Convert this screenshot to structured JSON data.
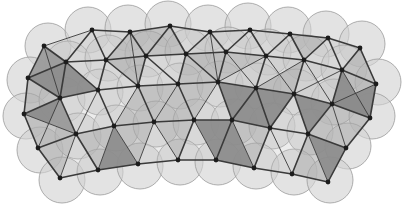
{
  "figure": {
    "type": "packing-triangulation-diagram",
    "title": "",
    "width": 404,
    "height": 222,
    "background_color": "#ffffff"
  },
  "style": {
    "disc_fill": "#d2d2d2",
    "disc_stroke": "#9a9a9a",
    "disc_opacity": 0.62,
    "disc_stroke_width": 0.8,
    "triangle_light_fill": "#c0c0c0",
    "triangle_dark_fill": "#8c8c8c",
    "triangle_mid_fill": "#a8a8a8",
    "edge_color": "#3a3a3a",
    "edge_width": 1.6,
    "edge_width_thin": 0.9,
    "node_color": "#1c1c1c",
    "node_radius": 2.4
  },
  "chart_data": {
    "type": "scatter",
    "title": "",
    "xlabel": "",
    "ylabel": "",
    "xlim": [
      0,
      404
    ],
    "ylim": [
      0,
      222
    ],
    "grid": false,
    "legend": null,
    "disc_radius": 23,
    "discs": [
      [
        48,
        46
      ],
      [
        88,
        30
      ],
      [
        128,
        28
      ],
      [
        168,
        24
      ],
      [
        208,
        28
      ],
      [
        248,
        26
      ],
      [
        288,
        30
      ],
      [
        326,
        34
      ],
      [
        362,
        44
      ],
      [
        30,
        80
      ],
      [
        68,
        64
      ],
      [
        108,
        58
      ],
      [
        148,
        54
      ],
      [
        188,
        52
      ],
      [
        228,
        50
      ],
      [
        268,
        52
      ],
      [
        306,
        58
      ],
      [
        344,
        68
      ],
      [
        378,
        82
      ],
      [
        26,
        116
      ],
      [
        62,
        100
      ],
      [
        100,
        92
      ],
      [
        140,
        88
      ],
      [
        180,
        86
      ],
      [
        220,
        84
      ],
      [
        258,
        86
      ],
      [
        296,
        92
      ],
      [
        334,
        102
      ],
      [
        372,
        116
      ],
      [
        40,
        150
      ],
      [
        78,
        136
      ],
      [
        116,
        128
      ],
      [
        156,
        124
      ],
      [
        196,
        122
      ],
      [
        234,
        122
      ],
      [
        272,
        126
      ],
      [
        310,
        132
      ],
      [
        348,
        146
      ],
      [
        62,
        180
      ],
      [
        100,
        172
      ],
      [
        140,
        166
      ],
      [
        180,
        162
      ],
      [
        218,
        162
      ],
      [
        256,
        166
      ],
      [
        294,
        172
      ],
      [
        330,
        180
      ]
    ],
    "nodes": [
      [
        44,
        46
      ],
      [
        92,
        30
      ],
      [
        130,
        32
      ],
      [
        170,
        26
      ],
      [
        210,
        32
      ],
      [
        250,
        30
      ],
      [
        290,
        34
      ],
      [
        328,
        38
      ],
      [
        360,
        48
      ],
      [
        28,
        78
      ],
      [
        66,
        62
      ],
      [
        106,
        60
      ],
      [
        146,
        56
      ],
      [
        186,
        54
      ],
      [
        226,
        52
      ],
      [
        266,
        56
      ],
      [
        304,
        60
      ],
      [
        342,
        70
      ],
      [
        376,
        84
      ],
      [
        24,
        114
      ],
      [
        60,
        98
      ],
      [
        98,
        90
      ],
      [
        138,
        86
      ],
      [
        178,
        84
      ],
      [
        218,
        82
      ],
      [
        256,
        88
      ],
      [
        294,
        94
      ],
      [
        332,
        104
      ],
      [
        370,
        118
      ],
      [
        38,
        148
      ],
      [
        76,
        134
      ],
      [
        114,
        126
      ],
      [
        154,
        122
      ],
      [
        194,
        120
      ],
      [
        232,
        120
      ],
      [
        270,
        128
      ],
      [
        308,
        134
      ],
      [
        346,
        148
      ],
      [
        60,
        178
      ],
      [
        98,
        170
      ],
      [
        138,
        164
      ],
      [
        178,
        160
      ],
      [
        216,
        160
      ],
      [
        254,
        168
      ],
      [
        292,
        174
      ],
      [
        328,
        182
      ]
    ],
    "node_count": 46,
    "edge_count": 142,
    "shaded_triangles": 14,
    "values": []
  }
}
